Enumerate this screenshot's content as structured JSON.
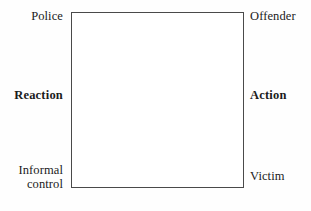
{
  "diagram": {
    "background_color": "#fefefe",
    "box": {
      "name": "central-square",
      "border_color": "#4a4a4a",
      "fill_color": "#ffffff"
    },
    "labels": {
      "top_left": "Police",
      "top_right": "Offender",
      "middle_left": "Reaction",
      "middle_right": "Action",
      "bottom_left": "Informal\ncontrol",
      "bottom_right": "Victim"
    }
  }
}
